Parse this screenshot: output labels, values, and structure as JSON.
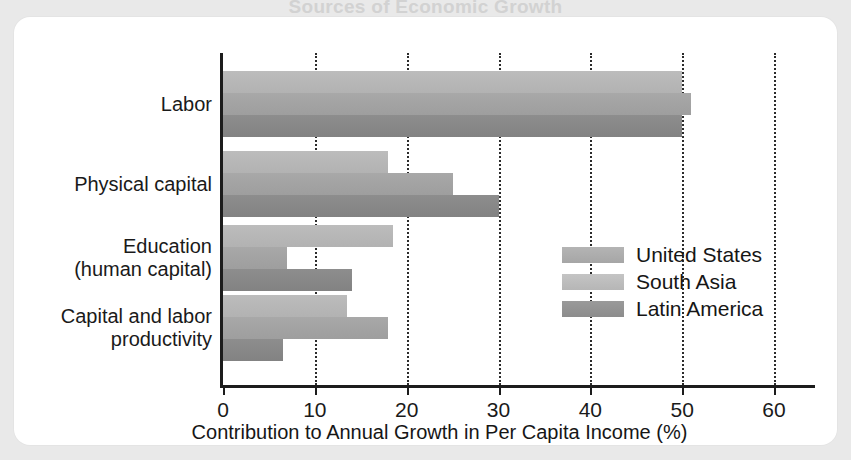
{
  "page": {
    "background_color": "#e9e9e9",
    "card_color": "#ffffff",
    "clipped_title": "Sources of Economic Growth"
  },
  "chart_data": {
    "type": "bar",
    "orientation": "horizontal",
    "grouped": true,
    "title": "",
    "xlabel": "Contribution to Annual Growth in Per Capita Income (%)",
    "ylabel": "",
    "xlim": [
      0,
      60
    ],
    "xticks": [
      0,
      10,
      20,
      30,
      40,
      50,
      60
    ],
    "xticklabels": [
      "0",
      "10",
      "20",
      "30",
      "40",
      "50",
      "60"
    ],
    "grid": "vertical-dotted",
    "legend_position": "center-right-inside",
    "categories": [
      "Labor",
      "Physical capital",
      "Education\n(human capital)",
      "Capital and labor\nproductivity"
    ],
    "category_lines": [
      [
        "Labor"
      ],
      [
        "Physical capital"
      ],
      [
        "Education",
        "(human capital)"
      ],
      [
        "Capital and labor",
        "productivity"
      ]
    ],
    "series": [
      {
        "name": "United States",
        "color": "#b4b4b4",
        "values": [
          50,
          18,
          18.5,
          13.5
        ]
      },
      {
        "name": "South Asia",
        "color": "#c4c4c4",
        "values": [
          51,
          25,
          7,
          18
        ]
      },
      {
        "name": "Latin America",
        "color": "#9a9a9a",
        "values": [
          50,
          30,
          14,
          6.5
        ]
      }
    ]
  },
  "axis": {
    "x_title": "Contribution to Annual Growth in Per Capita Income (%)"
  },
  "legend": {
    "entries": [
      {
        "label": "United States"
      },
      {
        "label": "South Asia"
      },
      {
        "label": "Latin America"
      }
    ]
  }
}
